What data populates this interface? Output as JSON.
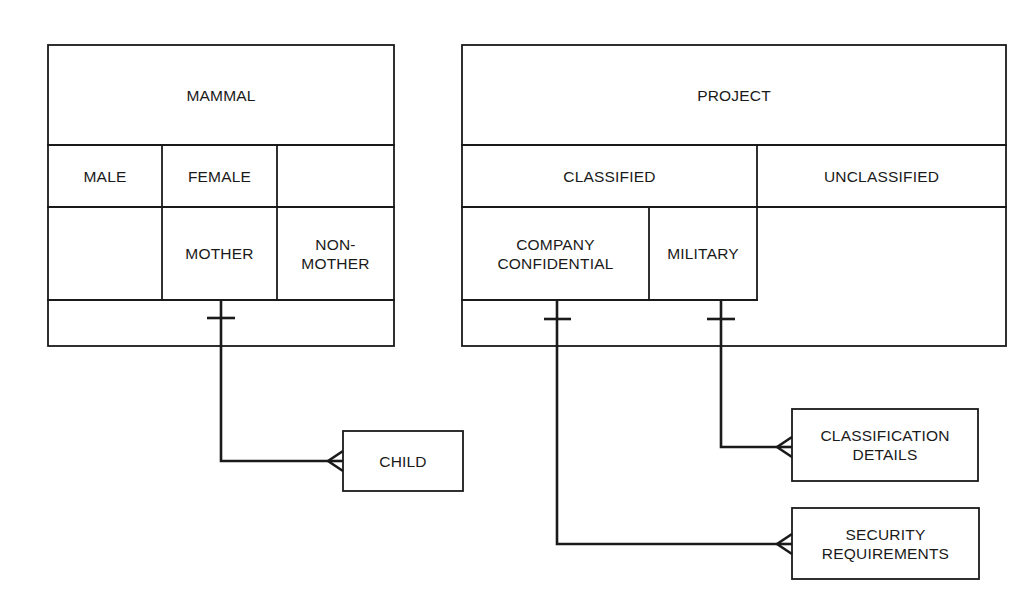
{
  "diagram": {
    "type": "entity-relationship (subtype partitions)",
    "stroke_color": "#1a1a1a",
    "background": "#ffffff"
  },
  "entities": {
    "mammal": {
      "title": "MAMMAL",
      "partition_1": [
        "MALE",
        "FEMALE",
        ""
      ],
      "partition_2": [
        "",
        "MOTHER",
        "NON-\nMOTHER"
      ]
    },
    "project": {
      "title": "PROJECT",
      "partition_1": [
        "CLASSIFIED",
        "UNCLASSIFIED"
      ],
      "partition_2": [
        "COMPANY\nCONFIDENTIAL",
        "MILITARY"
      ]
    },
    "child": {
      "title": "CHILD"
    },
    "classification_details": {
      "title": "CLASSIFICATION\nDETAILS"
    },
    "security_requirements": {
      "title": "SECURITY\nREQUIREMENTS"
    }
  },
  "relationships": [
    {
      "from": "MOTHER",
      "to": "CHILD",
      "from_cardinality": "one",
      "to_cardinality": "many"
    },
    {
      "from": "MILITARY",
      "to": "CLASSIFICATION DETAILS",
      "from_cardinality": "one",
      "to_cardinality": "many"
    },
    {
      "from": "COMPANY CONFIDENTIAL",
      "to": "SECURITY REQUIREMENTS",
      "from_cardinality": "one",
      "to_cardinality": "many"
    }
  ]
}
